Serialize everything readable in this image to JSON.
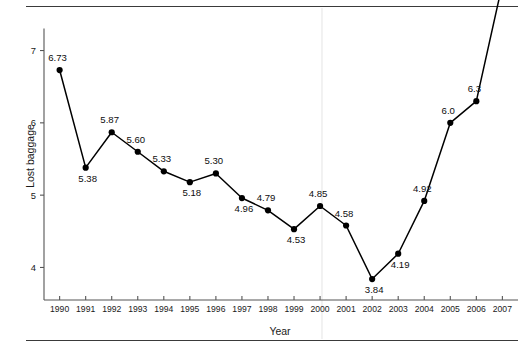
{
  "figure": {
    "xlabel": "Year",
    "ylabel": "Lost baggage"
  },
  "chart_data": {
    "type": "line",
    "title": "",
    "xlabel": "Year",
    "ylabel": "Lost baggage",
    "categories": [
      "1990",
      "1991",
      "1992",
      "1993",
      "1994",
      "1995",
      "1996",
      "1997",
      "1998",
      "1999",
      "2000",
      "2001",
      "2002",
      "2003",
      "2004",
      "2005",
      "2006",
      "2007"
    ],
    "x": [
      1990,
      1991,
      1992,
      1993,
      1994,
      1995,
      1996,
      1997,
      1998,
      1999,
      2000,
      2001,
      2002,
      2003,
      2004,
      2005,
      2006,
      2007
    ],
    "values": [
      6.73,
      5.38,
      5.87,
      5.6,
      5.33,
      5.18,
      5.3,
      4.96,
      4.79,
      4.53,
      4.85,
      4.58,
      3.84,
      4.19,
      4.92,
      6.0,
      6.3,
      7.92
    ],
    "point_labels": [
      "6.73",
      "5.38",
      "5.87",
      "5.60",
      "5.33",
      "5.18",
      "5.30",
      "4.96",
      "4.79",
      "4.53",
      "4.85",
      "4.58",
      "3.84",
      "4.19",
      "4.92",
      "6.0",
      "6.3",
      "7.92"
    ],
    "label_positions": [
      "above",
      "below",
      "above",
      "above",
      "above",
      "below",
      "above",
      "below",
      "above",
      "below",
      "above",
      "above",
      "below",
      "below",
      "above",
      "above",
      "above",
      "left"
    ],
    "yticks": [
      4,
      5,
      6,
      7
    ],
    "ytick_labels": [
      "4",
      "5",
      "6",
      "7"
    ],
    "xtick_labels": [
      "1990",
      "1991",
      "1992",
      "1993",
      "1994",
      "1995",
      "1996",
      "1997",
      "1998",
      "1999",
      "2000",
      "2001",
      "2002",
      "2003",
      "2004",
      "2005",
      "2006",
      "2007"
    ],
    "ylim": [
      3.55,
      7.45
    ],
    "xlim": [
      1989.4,
      2007.6
    ],
    "grid": false,
    "legend": false,
    "marker": "filled-circle",
    "line_color": "#000000",
    "marker_color": "#000000"
  }
}
